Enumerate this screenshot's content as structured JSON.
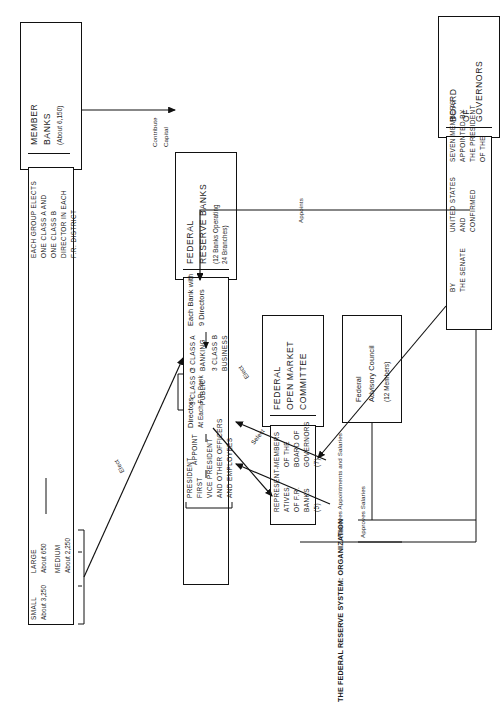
{
  "figure": {
    "title": "THE FEDERAL RESERVE SYSTEM: ORGANIZATION",
    "orientation": "rotated-90"
  },
  "boxes": {
    "member_banks": {
      "name": "MEMBER",
      "name2": "BANKS",
      "count": "(About 6,150)",
      "detail_l1": "EACH GROUP ELECTS",
      "detail_l2": "ONE CLASS A AND",
      "detail_l3": "ONE CLASS B",
      "detail_l4": "DIRECTOR IN EACH",
      "detail_l5": "F.R. DISTRICT",
      "groups": [
        {
          "size": "LARGE",
          "count": "About 650"
        },
        {
          "size": "MEDIUM",
          "count": "About 2,250"
        },
        {
          "size": "SMALL",
          "count": "About 3,250"
        }
      ]
    },
    "reserve_banks": {
      "name": "FEDERAL",
      "name2": "RESERVE BANKS",
      "count_l1": "(12 Banks Operating",
      "count_l2": "24 Branches)",
      "each_l1": "Each Bank with",
      "each_l2": "9 Directors",
      "classes": [
        {
          "num": "3 CLASS A",
          "kind": "BANKING"
        },
        {
          "num": "3 CLASS B",
          "kind": "BUSINESS"
        },
        {
          "num": "3 CLASS C",
          "kind": "PUBLIC"
        }
      ],
      "directors_l1": "Directors",
      "directors_l2": "At Each F.R. Bank",
      "appoint": "APPOINT",
      "officers_l1": "PRESIDENT",
      "officers_l2": "FIRST",
      "officers_l3": "VICE PRESIDENT",
      "officers_l4": "AND OTHER OFFICERS",
      "officers_l5": "AND EMPLOYEES"
    },
    "fomc": {
      "name_l1": "FEDERAL",
      "name_l2": "OPEN MARKET",
      "name_l3": "COMMITTEE",
      "members_l1": "MEMBERS",
      "members_l2": "OF THE",
      "members_l3": "BOARD OF",
      "members_l4": "GOVERNORS",
      "members_l5": "(7)",
      "reps_l1": "REPRESENT-",
      "reps_l2": "ATIVES",
      "reps_l3": "OF F.R.",
      "reps_l4": "BANKS",
      "reps_l5": "(5)"
    },
    "advisory_council": {
      "name_l1": "Federal",
      "name_l2": "Advisory Council",
      "count": "(12 Members)"
    },
    "board_of_governors": {
      "name_l1": "BOARD",
      "name_l2": "OF",
      "name_l3": "GOVERNORS",
      "detail_l1": "SEVEN MEMBERS",
      "detail_l2": "APPOINTED BY",
      "detail_l3": "THE PRESIDENT",
      "detail_l4": "OF THE",
      "detail_l5": "UNITED STATES",
      "detail_l6": "AND",
      "detail_l7": "CONFIRMED",
      "detail_l8": "BY",
      "detail_l9": "THE SENATE"
    }
  },
  "connectors": {
    "contribute": "Contribute",
    "capital": "Capital",
    "elect_banks": "Elect",
    "elect_fomc": "Elect",
    "select": "Select",
    "appoints": "Appoints",
    "approves_appointments": "Approves Appointments and Salaries",
    "approves_salaries": "Approves Salaries"
  }
}
